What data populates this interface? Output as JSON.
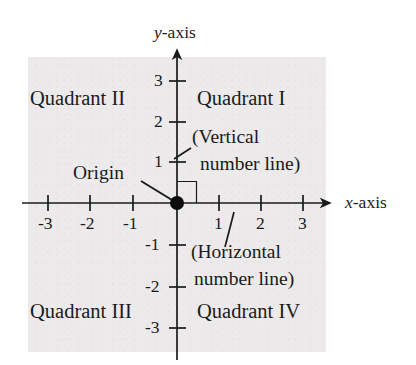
{
  "figure": {
    "type": "coordinate-plane-diagram",
    "background_color": "#ffffff",
    "panel_color": "#eceaea",
    "ink_color": "#1b1b1b"
  },
  "axes": {
    "y_axis_label": "y-axis",
    "y_axis_label_italic_part": "y",
    "y_axis_label_rest": "-axis",
    "x_axis_label": "x-axis",
    "x_axis_label_italic_part": "x",
    "x_axis_label_rest": "-axis",
    "x_ticks": [
      "-3",
      "-2",
      "-1",
      "1",
      "2",
      "3"
    ],
    "y_ticks": [
      "3",
      "2",
      "1",
      "-1",
      "-2",
      "-3"
    ],
    "x_range": [
      -3.6,
      3.7
    ],
    "y_range": [
      -3.6,
      3.8
    ]
  },
  "origin": {
    "label": "Origin",
    "point": [
      0,
      0
    ]
  },
  "quadrants": {
    "q1": "Quadrant I",
    "q2": "Quadrant II",
    "q3": "Quadrant III",
    "q4": "Quadrant IV"
  },
  "annotations": {
    "vertical_line1": "(Vertical",
    "vertical_line2": "number line)",
    "horizontal_line1": "(Horizontal",
    "horizontal_line2": "number line)"
  }
}
